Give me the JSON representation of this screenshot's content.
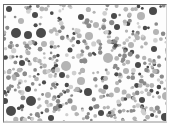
{
  "image": {
    "description": "Grayscale dot-pattern plate (Ishihara-style) with scattered circles of varying size and shade",
    "width": 164,
    "height": 119,
    "colors": {
      "background": "#fdfdfd",
      "dark": "#4a4a4a",
      "mid": "#8a8a8a",
      "light": "#b4b4b4",
      "pale": "#cfcfcf"
    },
    "featured_dots": [
      {
        "x": 12,
        "y": 28,
        "r": 5,
        "c": "dark"
      },
      {
        "x": 24,
        "y": 30,
        "r": 4,
        "c": "dark"
      },
      {
        "x": 37,
        "y": 28,
        "r": 5,
        "c": "dark"
      },
      {
        "x": 5,
        "y": 4,
        "r": 3,
        "c": "dark"
      },
      {
        "x": 27,
        "y": 96,
        "r": 5,
        "c": "dark"
      },
      {
        "x": 7,
        "y": 106,
        "r": 5,
        "c": "dark"
      },
      {
        "x": 84,
        "y": 87,
        "r": 4,
        "c": "dark"
      },
      {
        "x": 47,
        "y": 113,
        "r": 3,
        "c": "dark"
      },
      {
        "x": 161,
        "y": 112,
        "r": 4,
        "c": "dark"
      },
      {
        "x": 149,
        "y": 6,
        "r": 4,
        "c": "dark"
      },
      {
        "x": 110,
        "y": 11,
        "r": 3,
        "c": "dark"
      },
      {
        "x": 77,
        "y": 12,
        "r": 3,
        "c": "dark"
      },
      {
        "x": 31,
        "y": 10,
        "r": 3,
        "c": "dark"
      },
      {
        "x": 113,
        "y": 22,
        "r": 3,
        "c": "dark"
      },
      {
        "x": 1,
        "y": 96,
        "r": 3,
        "c": "dark"
      },
      {
        "x": 24,
        "y": 84,
        "r": 3,
        "c": "dark"
      },
      {
        "x": 66,
        "y": 45,
        "r": 2.5,
        "c": "dark"
      },
      {
        "x": 134,
        "y": 60,
        "r": 3,
        "c": "dark"
      },
      {
        "x": 138,
        "y": 95,
        "r": 3,
        "c": "dark"
      },
      {
        "x": 97,
        "y": 108,
        "r": 3,
        "c": "dark"
      },
      {
        "x": 58,
        "y": 70,
        "r": 3,
        "c": "dark"
      },
      {
        "x": 150,
        "y": 44,
        "r": 3,
        "c": "dark"
      },
      {
        "x": 18,
        "y": 58,
        "r": 3,
        "c": "dark"
      },
      {
        "x": 85,
        "y": 31,
        "r": 4,
        "c": "light"
      },
      {
        "x": 104,
        "y": 53,
        "r": 5,
        "c": "light"
      },
      {
        "x": 62,
        "y": 61,
        "r": 5,
        "c": "light"
      },
      {
        "x": 77,
        "y": 76,
        "r": 4,
        "c": "light"
      },
      {
        "x": 137,
        "y": 11,
        "r": 4,
        "c": "light"
      },
      {
        "x": 162,
        "y": 91,
        "r": 4,
        "c": "light"
      },
      {
        "x": 40,
        "y": 39,
        "r": 3,
        "c": "light"
      },
      {
        "x": 122,
        "y": 66,
        "r": 3,
        "c": "light"
      },
      {
        "x": 17,
        "y": 16,
        "r": 3,
        "c": "light"
      },
      {
        "x": 92,
        "y": 20,
        "r": 3,
        "c": "light"
      },
      {
        "x": 127,
        "y": 40,
        "r": 3,
        "c": "light"
      },
      {
        "x": 44,
        "y": 90,
        "r": 3,
        "c": "light"
      },
      {
        "x": 113,
        "y": 85,
        "r": 3,
        "c": "light"
      },
      {
        "x": 70,
        "y": 103,
        "r": 3,
        "c": "light"
      },
      {
        "x": 152,
        "y": 27,
        "r": 3,
        "c": "light"
      }
    ],
    "fill": {
      "seed": 7,
      "count": 520,
      "min_r": 1.2,
      "max_r": 2.6
    }
  }
}
